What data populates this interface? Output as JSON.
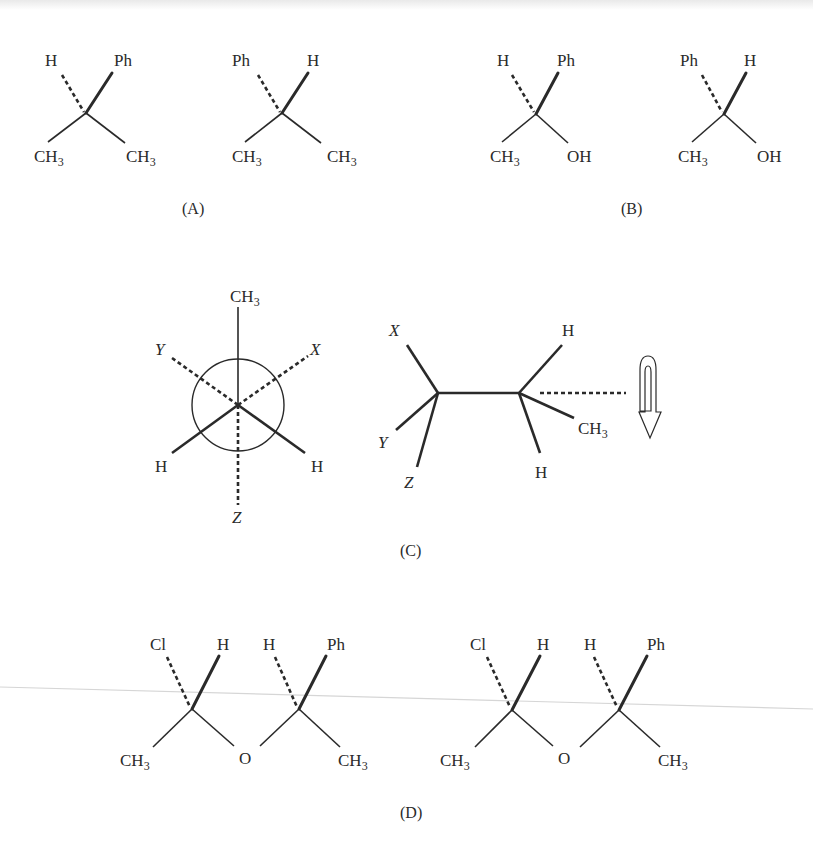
{
  "figure": {
    "panels": [
      {
        "id": "A",
        "caption": "(A)",
        "structures": [
          {
            "top_left": "H",
            "top_right": "Ph",
            "bottom_left": "CH",
            "bottom_left_sub": "3",
            "bottom_right": "CH",
            "bottom_right_sub": "3",
            "dashed": "top_left",
            "wedge": "top_right"
          },
          {
            "top_left": "Ph",
            "top_right": "H",
            "bottom_left": "CH",
            "bottom_left_sub": "3",
            "bottom_right": "CH",
            "bottom_right_sub": "3",
            "dashed": "top_left",
            "wedge": "top_right"
          }
        ]
      },
      {
        "id": "B",
        "caption": "(B)",
        "structures": [
          {
            "top_left": "H",
            "top_right": "Ph",
            "bottom_left": "CH",
            "bottom_left_sub": "3",
            "bottom_right": "OH",
            "dashed": "top_left",
            "wedge": "top_right"
          },
          {
            "top_left": "Ph",
            "top_right": "H",
            "bottom_left": "CH",
            "bottom_left_sub": "3",
            "bottom_right": "OH",
            "dashed": "top_left",
            "wedge": "top_right"
          }
        ]
      },
      {
        "id": "C",
        "caption": "(C)",
        "newman": {
          "top": "CH",
          "top_sub": "3",
          "front_left": "H",
          "front_right": "H",
          "back_upper_left": "Y",
          "back_upper_right": "X",
          "back_bottom": "Z"
        },
        "sawhorse": {
          "left_up": "X",
          "left_mid": "Y",
          "left_down": "Z",
          "right_up": "H",
          "right_mid": "CH",
          "right_mid_sub": "3",
          "right_down": "H"
        },
        "rotation_arrow": "u-turn-arrow"
      },
      {
        "id": "D",
        "caption": "(D)",
        "structures": [
          {
            "c1_top_left": "Cl",
            "c1_top_right": "H",
            "c2_top_left": "H",
            "c2_top_right": "Ph",
            "left_bottom": "CH",
            "left_bottom_sub": "3",
            "center": "O",
            "right_bottom": "CH",
            "right_bottom_sub": "3"
          },
          {
            "c1_top_left": "Cl",
            "c1_top_right": "H",
            "c2_top_left": "H",
            "c2_top_right": "Ph",
            "left_bottom": "CH",
            "left_bottom_sub": "3",
            "center": "O",
            "right_bottom": "CH",
            "right_bottom_sub": "3"
          }
        ]
      }
    ]
  }
}
